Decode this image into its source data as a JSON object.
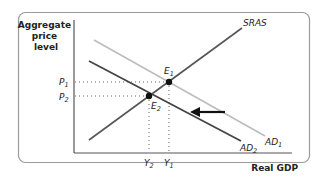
{
  "diagram": {
    "type": "AD-AS model",
    "y_axis_label": [
      "Aggregate",
      "price",
      "level"
    ],
    "x_axis_label": "Real GDP",
    "curves": [
      {
        "name": "SRAS",
        "label": "SRAS",
        "color": "#555555"
      },
      {
        "name": "AD1",
        "label": "AD",
        "subscript": "1",
        "color": "#bbbbbb"
      },
      {
        "name": "AD2",
        "label": "AD",
        "subscript": "2",
        "color": "#444444"
      }
    ],
    "equilibria": [
      {
        "label": "E",
        "subscript": "1"
      },
      {
        "label": "E",
        "subscript": "2"
      }
    ],
    "price_ticks": [
      {
        "label": "P",
        "subscript": "1"
      },
      {
        "label": "P",
        "subscript": "2"
      }
    ],
    "output_ticks": [
      {
        "label": "Y",
        "subscript": "2"
      },
      {
        "label": "Y",
        "subscript": "1"
      }
    ],
    "shift_arrow": "leftward shift of AD"
  }
}
